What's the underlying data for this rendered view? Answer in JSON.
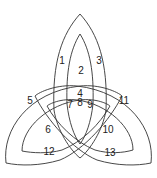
{
  "diagram": {
    "type": "three-set nested arch Venn diagram",
    "stroke_color": "#333333",
    "background": "#ffffff",
    "regions": [
      {
        "id": "1",
        "label": "1",
        "x": 62,
        "y": 61
      },
      {
        "id": "2",
        "label": "2",
        "x": 81,
        "y": 71
      },
      {
        "id": "3",
        "label": "3",
        "x": 99,
        "y": 61
      },
      {
        "id": "4",
        "label": "4",
        "x": 80,
        "y": 94
      },
      {
        "id": "5",
        "label": "5",
        "x": 30,
        "y": 101
      },
      {
        "id": "6",
        "label": "6",
        "x": 48,
        "y": 130
      },
      {
        "id": "7",
        "label": "7",
        "x": 70,
        "y": 105
      },
      {
        "id": "8",
        "label": "8",
        "x": 80,
        "y": 104
      },
      {
        "id": "9",
        "label": "9",
        "x": 90,
        "y": 105
      },
      {
        "id": "10",
        "label": "10",
        "x": 108,
        "y": 130
      },
      {
        "id": "11",
        "label": "11",
        "x": 124,
        "y": 101
      },
      {
        "id": "12",
        "label": "12",
        "x": 49,
        "y": 152
      },
      {
        "id": "13",
        "label": "13",
        "x": 110,
        "y": 153
      }
    ]
  }
}
